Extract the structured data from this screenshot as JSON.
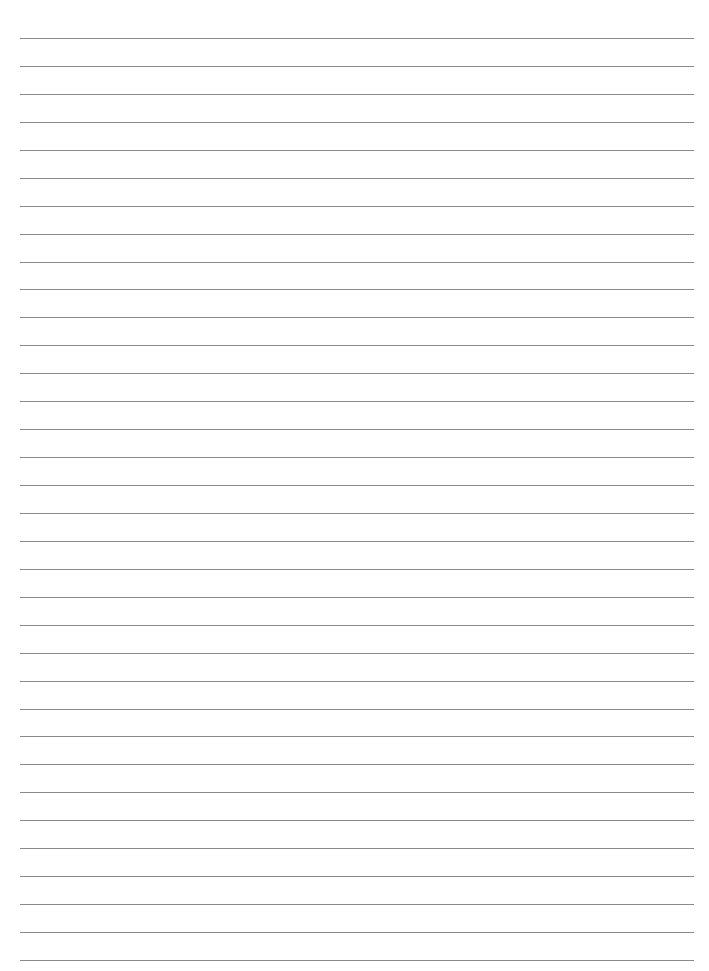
{
  "document": {
    "type": "ruled-paper",
    "line_count": 34,
    "line_color": "#8a8a8a",
    "background_color": "#ffffff",
    "text_content": ""
  }
}
